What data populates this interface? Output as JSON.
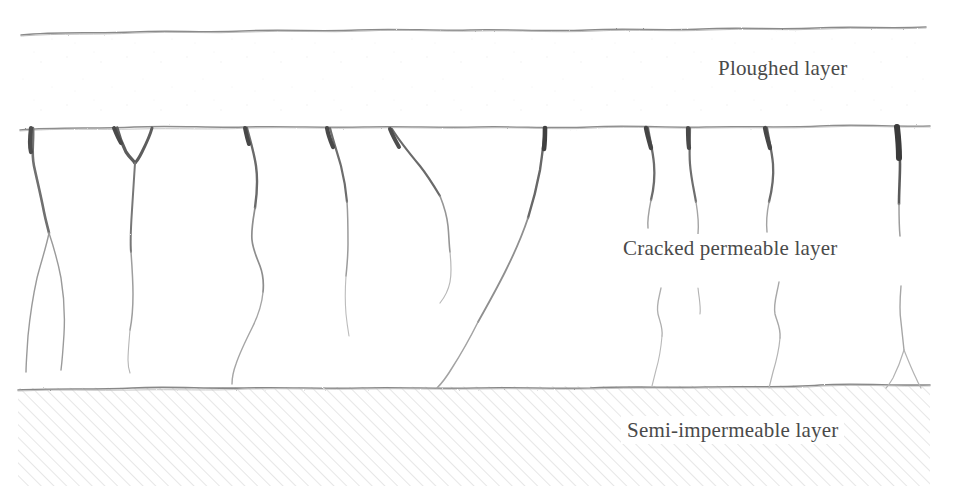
{
  "figure": {
    "type": "cross-section-diagram",
    "width": 957,
    "height": 486,
    "background_color": "#ffffff",
    "ink_color": "#5a5a5a",
    "hatch_color": "#c8c8c8",
    "text_color": "#4a4a4a"
  },
  "labels": {
    "ploughed": "Ploughed layer",
    "cracked": "Cracked permeable layer",
    "semi": "Semi-impermeable layer"
  },
  "layers": [
    {
      "id": "ploughed",
      "name": "Ploughed layer",
      "top_y": 30,
      "bottom_y": 127,
      "fill": "#ffffff",
      "texture": "fine-speckle"
    },
    {
      "id": "cracked",
      "name": "Cracked permeable layer",
      "top_y": 127,
      "bottom_y": 387,
      "fill": "#ffffff",
      "texture": "vertical-cracks"
    },
    {
      "id": "semi",
      "name": "Semi-impermeable layer",
      "top_y": 387,
      "bottom_y": 486,
      "fill": "#ffffff",
      "texture": "diagonal-hatch",
      "hatch_angle_deg": 45,
      "hatch_spacing_px": 9
    }
  ],
  "boundaries": [
    {
      "id": "ground-surface",
      "y": 32,
      "x_start": 20,
      "x_end": 926,
      "style": "irregular-hand-drawn"
    },
    {
      "id": "ploughed-base",
      "y": 127,
      "x_start": 20,
      "x_end": 930,
      "style": "irregular-hand-drawn"
    },
    {
      "id": "semi-top",
      "y": 387,
      "x_start": 18,
      "x_end": 930,
      "style": "irregular-hand-drawn"
    }
  ],
  "cracks": {
    "count": 10,
    "origin_x_positions": [
      33,
      117,
      150,
      245,
      328,
      390,
      545,
      648,
      690,
      767,
      898
    ],
    "description": "Near-vertical cracks descending from the base of the ploughed layer into the cracked permeable layer; several branch or fork, one long oblique crack reaches the semi-impermeable layer."
  }
}
